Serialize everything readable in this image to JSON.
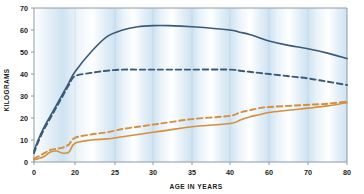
{
  "chart_data": {
    "type": "line",
    "title": "",
    "xlabel": "AGE IN YEARS",
    "ylabel": "KILOGRAMS",
    "xticks": [
      0,
      20,
      25,
      30,
      35,
      40,
      60,
      70,
      80
    ],
    "xtick_labels": [
      "0",
      "20",
      "25",
      "30",
      "35",
      "40",
      "60",
      "70",
      "80"
    ],
    "xtick_positions_px": [
      34,
      75,
      115,
      153,
      192,
      230,
      269,
      308,
      347
    ],
    "yticks": [
      0,
      10,
      20,
      30,
      40,
      50,
      60,
      70
    ],
    "ytick_labels": [
      "0",
      "10",
      "20",
      "30",
      "40",
      "50",
      "60",
      "70"
    ],
    "ylim": [
      0,
      70
    ],
    "grid": false,
    "axis_note": "x-axis uses a non-linear (compressed 0-20) scale",
    "background_bands": "alternating vertical pale blue / white stripes",
    "legend_position": "none",
    "colors": {
      "male_lean_solid": "#3c5a77",
      "male_dashed": "#3c5a77",
      "female_solid": "#d4903f",
      "female_dashed": "#d4903f",
      "band_light": "#ffffff",
      "band_blue": "#d6e6f2",
      "axis": "#8c9aa6",
      "text": "#1b1b1b"
    },
    "series": [
      {
        "name": "blue-solid",
        "style": "solid",
        "color": "#3c5a77",
        "x": [
          0,
          2,
          5,
          8,
          11,
          14,
          17,
          20,
          22,
          24,
          26,
          28,
          30,
          32,
          35,
          40,
          45,
          50,
          55,
          60,
          65,
          70,
          75,
          80
        ],
        "y": [
          5,
          10,
          16,
          21,
          26,
          31,
          36,
          41,
          50,
          57,
          60,
          61.5,
          62,
          62,
          61.5,
          60,
          59,
          58,
          56.5,
          55,
          53,
          51.5,
          49.5,
          47
        ]
      },
      {
        "name": "blue-dashed",
        "style": "dashed",
        "color": "#3c5a77",
        "x": [
          0,
          2,
          5,
          8,
          11,
          14,
          17,
          20,
          22,
          24,
          26,
          28,
          30,
          32,
          35,
          40,
          45,
          50,
          55,
          60,
          65,
          70,
          75,
          80
        ],
        "y": [
          4,
          9,
          15,
          20,
          25,
          30,
          35,
          39,
          40.5,
          41.5,
          42,
          42,
          42,
          42,
          42,
          42,
          41.5,
          41,
          40.5,
          40,
          39,
          38,
          36.5,
          35
        ]
      },
      {
        "name": "orange-dashed",
        "style": "dashed",
        "color": "#d4903f",
        "x": [
          0,
          2,
          5,
          8,
          11,
          14,
          17,
          20,
          22,
          24,
          26,
          28,
          30,
          32,
          35,
          40,
          45,
          50,
          55,
          60,
          65,
          70,
          75,
          80
        ],
        "y": [
          1.5,
          2.5,
          4,
          5.5,
          6,
          6.5,
          8,
          11,
          12.5,
          13.5,
          15,
          16,
          17,
          18,
          19.5,
          21,
          22.5,
          23.5,
          24.5,
          25,
          25.5,
          26,
          26.5,
          27.5
        ]
      },
      {
        "name": "orange-solid",
        "style": "solid",
        "color": "#d4903f",
        "x": [
          0,
          2,
          5,
          8,
          11,
          14,
          17,
          20,
          22,
          24,
          26,
          28,
          30,
          32,
          35,
          40,
          45,
          50,
          55,
          60,
          65,
          70,
          75,
          80
        ],
        "y": [
          1,
          1.5,
          2.5,
          4.5,
          5,
          4,
          4.5,
          8.5,
          10,
          10.5,
          11.5,
          12.5,
          13.5,
          14.5,
          16,
          17.5,
          19,
          20.5,
          21.5,
          22.5,
          23.5,
          24.5,
          25.5,
          27
        ]
      }
    ]
  }
}
